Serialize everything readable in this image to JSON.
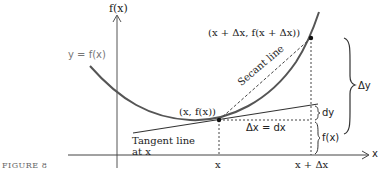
{
  "figure": {
    "caption": "FIGURE 8",
    "axes": {
      "y_label": "f(x)",
      "x_label": "x"
    },
    "curve_label": "y = f(x)",
    "points": {
      "base": "(x, f(x))",
      "shifted": "(x + Δx, f(x + Δx))"
    },
    "lines": {
      "secant": "Secant line",
      "tangent_line1": "Tangent line",
      "tangent_line2": "at x"
    },
    "annotations": {
      "delta_x": "Δx = dx",
      "delta_y": "Δy",
      "dy": "dy",
      "fx_brace": "f(x)"
    },
    "ticks": {
      "x": "x",
      "x_plus_dx": "x + Δx"
    },
    "colors": {
      "curve": "#555555",
      "axes": "#333333",
      "text": "#222222"
    }
  }
}
